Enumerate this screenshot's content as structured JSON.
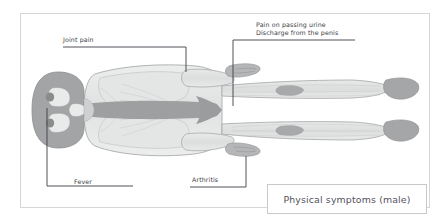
{
  "figure": {
    "caption": "Physical symptoms (male)",
    "frame_color": "#d6d6d6",
    "background": "#ffffff"
  },
  "annotations": [
    {
      "id": "joint-pain",
      "lines": [
        "Joint pain"
      ],
      "leader": "horizontal-right-then-down-to-shoulder"
    },
    {
      "id": "urinary",
      "lines": [
        "Pain on passing urine",
        "Discharge from the penis"
      ],
      "leader": "horizontal-left-then-down-to-pelvis"
    },
    {
      "id": "fever",
      "lines": [
        "Fever"
      ],
      "leader": "up-from-baseline-to-head"
    },
    {
      "id": "arthritis",
      "lines": [
        "Arthritis"
      ],
      "leader": "right-then-up-to-hand"
    }
  ],
  "colors": {
    "skin_fill": "#eceded",
    "muscle_fill": "#dcdddd",
    "bone_fill": "#9e9fa1",
    "outline": "#a9aaac",
    "leader_line": "#3f3f47",
    "label_text": "#3b3b46",
    "caption_text": "#53535d"
  }
}
